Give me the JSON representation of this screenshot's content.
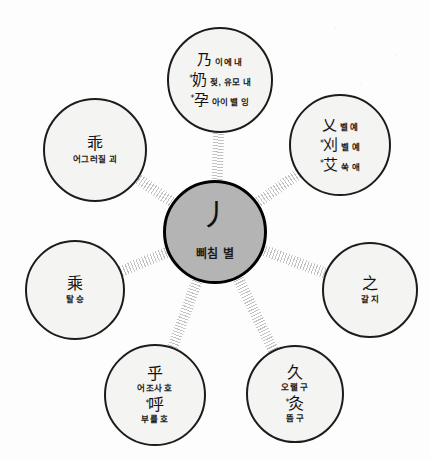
{
  "diagram": {
    "type": "radial-hub-and-spoke",
    "title_glyph": "丿",
    "colors": {
      "center_fill": "#b4b4b4",
      "outer_fill": "#f4f4f2",
      "border": "#1c1c1c",
      "spoke": "#bfbfbf",
      "background": "#fdfdfd",
      "text": "#191919"
    },
    "center": {
      "glyph": "丿",
      "reading": "삐침 별"
    },
    "nodes": [
      {
        "id": "node-top",
        "position": "top",
        "entries": [
          {
            "star": "",
            "glyph": "乃",
            "reading": "이에 내",
            "layout": "inline"
          },
          {
            "star": "*",
            "glyph": "奶",
            "reading": "젖, 유모 내",
            "layout": "inline"
          },
          {
            "star": "*",
            "glyph": "孕",
            "reading": "아이 밸 잉",
            "layout": "inline"
          }
        ]
      },
      {
        "id": "node-upper-right",
        "position": "upper-right",
        "entries": [
          {
            "star": "",
            "glyph": "乂",
            "reading": "벨 예",
            "layout": "inline"
          },
          {
            "star": "*",
            "glyph": "刈",
            "reading": "벨 예",
            "layout": "inline"
          },
          {
            "star": "*",
            "glyph": "艾",
            "reading": "쑥 애",
            "layout": "inline"
          }
        ]
      },
      {
        "id": "node-right",
        "position": "right",
        "entries": [
          {
            "star": "",
            "glyph": "之",
            "reading": "갈 지",
            "layout": "block"
          }
        ]
      },
      {
        "id": "node-lower-right",
        "position": "lower-right",
        "entries": [
          {
            "star": "",
            "glyph": "久",
            "reading": "오랠 구",
            "layout": "block"
          },
          {
            "star": "*",
            "glyph": "灸",
            "reading": "뜸 구",
            "layout": "block"
          }
        ]
      },
      {
        "id": "node-lower-left",
        "position": "lower-left",
        "entries": [
          {
            "star": "",
            "glyph": "乎",
            "reading": "어조사 호",
            "layout": "block"
          },
          {
            "star": "*",
            "glyph": "呼",
            "reading": "부를 호",
            "layout": "block"
          }
        ]
      },
      {
        "id": "node-left",
        "position": "left",
        "entries": [
          {
            "star": "",
            "glyph": "乘",
            "reading": "탈 승",
            "layout": "block"
          }
        ]
      },
      {
        "id": "node-upper-left",
        "position": "upper-left",
        "entries": [
          {
            "star": "",
            "glyph": "乖",
            "reading": "어그러질 괴",
            "layout": "block"
          }
        ]
      }
    ]
  },
  "geometry": {
    "center": {
      "cx": 215,
      "cy": 232,
      "r": 52
    },
    "outer_nodes": [
      {
        "id": "node-top",
        "cx": 220,
        "cy": 80,
        "r": 53
      },
      {
        "id": "node-upper-right",
        "cx": 340,
        "cy": 145,
        "r": 51
      },
      {
        "id": "node-right",
        "cx": 370,
        "cy": 290,
        "r": 48
      },
      {
        "id": "node-lower-right",
        "cx": 295,
        "cy": 394,
        "r": 49
      },
      {
        "id": "node-lower-left",
        "cx": 155,
        "cy": 395,
        "r": 51
      },
      {
        "id": "node-left",
        "cx": 75,
        "cy": 290,
        "r": 50
      },
      {
        "id": "node-upper-left",
        "cx": 95,
        "cy": 150,
        "r": 52
      }
    ]
  }
}
